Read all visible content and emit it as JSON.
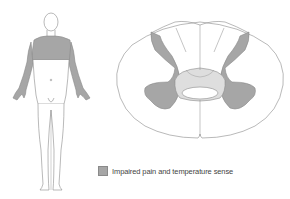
{
  "figure": {
    "body_figure": {
      "label": "body-diagram",
      "shaded_region": "shoulders-upper-chest-arms"
    },
    "spinal_cord": {
      "label": "spinal-cord-cross-section",
      "shaded_region": "central-gray-matter-lateral-horns"
    }
  },
  "legend": {
    "label": "Impaired pain and temperature sense",
    "swatch_color": "#a6a6a6"
  },
  "colors": {
    "shade": "#a6a6a6",
    "light_shade": "#dedede",
    "outline": "#8a8a8a"
  }
}
